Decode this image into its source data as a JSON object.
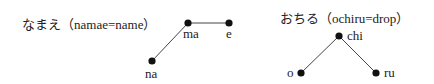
{
  "diagrams": [
    {
      "caption": "なまえ（namae=name）",
      "nodes": [
        {
          "label": "na",
          "x": 152,
          "y": 61
        },
        {
          "label": "ma",
          "x": 188,
          "y": 23
        },
        {
          "label": "e",
          "x": 229,
          "y": 23
        }
      ]
    },
    {
      "caption": "おちる（ochiru=drop）",
      "nodes": [
        {
          "label": "o",
          "x": 301,
          "y": 73
        },
        {
          "label": "chi",
          "x": 339,
          "y": 36
        },
        {
          "label": "ru",
          "x": 376,
          "y": 73
        }
      ]
    }
  ],
  "colors": {
    "line": "#444444",
    "node": "#111111",
    "text": "#222222"
  }
}
